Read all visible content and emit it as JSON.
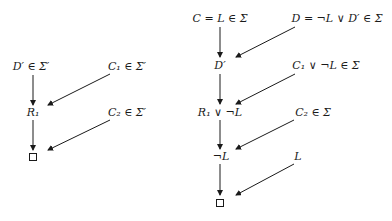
{
  "diagrams": [
    {
      "name": "left-derivation",
      "nodes": [
        {
          "id": "d_prime_in_sigma_prime",
          "label": "D′ ∈ Σ′",
          "x": 31,
          "y": 67
        },
        {
          "id": "c1_in_sigma_prime",
          "label": "C₁ ∈ Σ′",
          "x": 127,
          "y": 67
        },
        {
          "id": "r1",
          "label": "R₁",
          "x": 33,
          "y": 113
        },
        {
          "id": "c2_in_sigma_prime",
          "label": "C₂ ∈ Σ′",
          "x": 127,
          "y": 113
        },
        {
          "id": "empty_clause",
          "label": "□",
          "x": 33,
          "y": 157,
          "shape": "box"
        }
      ],
      "edges": [
        {
          "from": "d_prime_in_sigma_prime",
          "to": "r1",
          "x1": 33,
          "y1": 75,
          "x2": 33,
          "y2": 105
        },
        {
          "from": "c1_in_sigma_prime",
          "to": "r1",
          "x1": 110,
          "y1": 74,
          "x2": 48,
          "y2": 105
        },
        {
          "from": "r1",
          "to": "empty_clause",
          "x1": 33,
          "y1": 120,
          "x2": 33,
          "y2": 150
        },
        {
          "from": "c2_in_sigma_prime",
          "to": "empty_clause",
          "x1": 110,
          "y1": 120,
          "x2": 48,
          "y2": 150
        }
      ]
    },
    {
      "name": "right-derivation",
      "nodes": [
        {
          "id": "c_eq_l_in_sigma",
          "label": "C = L ∈ Σ",
          "x": 220,
          "y": 19
        },
        {
          "id": "d_eq_notl_or_dprime",
          "label": "D = ¬L ∨ D′ ∈ Σ",
          "x": 337,
          "y": 19
        },
        {
          "id": "d_prime",
          "label": "D′",
          "x": 220,
          "y": 66
        },
        {
          "id": "c1_or_notl_in_sigma",
          "label": "C₁ ∨ ¬L ∈ Σ",
          "x": 326,
          "y": 66
        },
        {
          "id": "r1_or_notl",
          "label": "R₁ ∨ ¬L",
          "x": 220,
          "y": 113
        },
        {
          "id": "c2_in_sigma",
          "label": "C₂ ∈ Σ",
          "x": 313,
          "y": 113
        },
        {
          "id": "notl",
          "label": "¬L",
          "x": 221,
          "y": 157
        },
        {
          "id": "l",
          "label": "L",
          "x": 298,
          "y": 157
        },
        {
          "id": "empty_clause_right",
          "label": "□",
          "x": 220,
          "y": 203,
          "shape": "box"
        }
      ],
      "edges": [
        {
          "from": "c_eq_l_in_sigma",
          "to": "d_prime",
          "x1": 220,
          "y1": 27,
          "x2": 220,
          "y2": 57
        },
        {
          "from": "d_eq_notl_or_dprime",
          "to": "d_prime",
          "x1": 295,
          "y1": 27,
          "x2": 236,
          "y2": 57
        },
        {
          "from": "d_prime",
          "to": "r1_or_notl",
          "x1": 220,
          "y1": 74,
          "x2": 220,
          "y2": 104
        },
        {
          "from": "c1_or_notl_in_sigma",
          "to": "r1_or_notl",
          "x1": 295,
          "y1": 74,
          "x2": 236,
          "y2": 104
        },
        {
          "from": "r1_or_notl",
          "to": "notl",
          "x1": 220,
          "y1": 120,
          "x2": 220,
          "y2": 149
        },
        {
          "from": "c2_in_sigma",
          "to": "notl",
          "x1": 294,
          "y1": 120,
          "x2": 236,
          "y2": 149
        },
        {
          "from": "notl",
          "to": "empty_clause_right",
          "x1": 220,
          "y1": 164,
          "x2": 220,
          "y2": 195
        },
        {
          "from": "l",
          "to": "empty_clause_right",
          "x1": 294,
          "y1": 164,
          "x2": 236,
          "y2": 195
        }
      ]
    }
  ],
  "colors": {
    "ink": "#1a1a1a",
    "background": "#ffffff"
  }
}
